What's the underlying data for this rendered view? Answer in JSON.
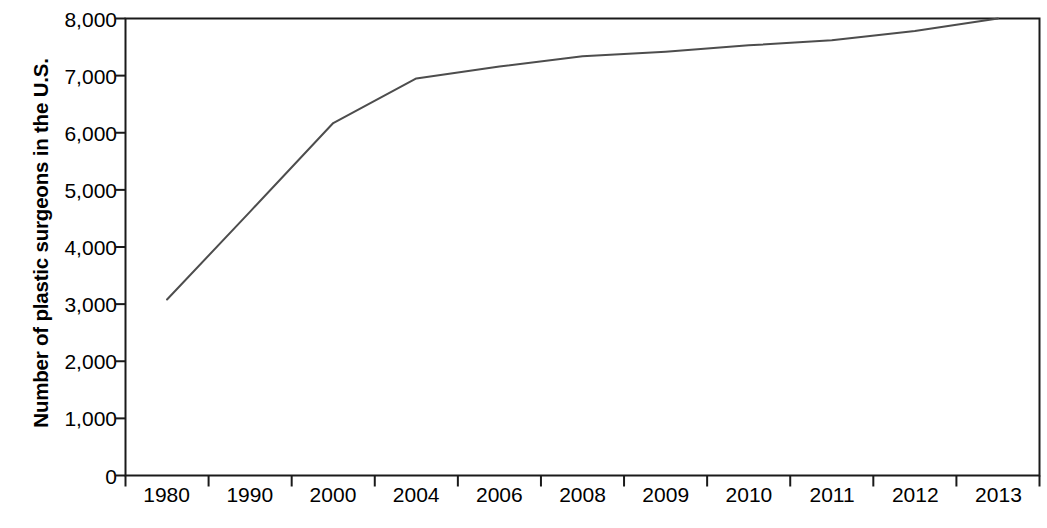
{
  "chart_data": {
    "type": "line",
    "title": "",
    "xlabel": "",
    "ylabel": "Number of plastic surgeons in the U.S.",
    "categories": [
      "1980",
      "1990",
      "2000",
      "2004",
      "2006",
      "2008",
      "2009",
      "2010",
      "2011",
      "2012",
      "2013"
    ],
    "values": [
      3080,
      4620,
      6170,
      6950,
      7160,
      7340,
      7420,
      7530,
      7620,
      7780,
      8000
    ],
    "series": [
      {
        "name": "Number of plastic surgeons in the U.S.",
        "values": [
          3080,
          4620,
          6170,
          6950,
          7160,
          7340,
          7420,
          7530,
          7620,
          7780,
          8000
        ]
      }
    ],
    "ylim": [
      0,
      8000
    ],
    "ytick_labels": [
      "8,000",
      "7,000",
      "6,000",
      "5,000",
      "4,000",
      "3,000",
      "2,000",
      "1,000",
      "0"
    ],
    "ytick_values": [
      8000,
      7000,
      6000,
      5000,
      4000,
      3000,
      2000,
      1000,
      0
    ],
    "grid": false,
    "legend": "none",
    "line_color": "#4d4d4d",
    "axis_color": "#1a1a1a",
    "background": "#ffffff"
  },
  "axes": {
    "y_title": "Number of plastic surgeons in the U.S."
  }
}
